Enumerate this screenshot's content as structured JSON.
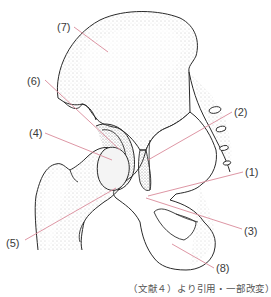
{
  "figure": {
    "type": "anatomical-illustration",
    "leader_line_color": "#d98a9a",
    "outline_color": "#2a2a2a",
    "stipple_color": "#8a8a8a"
  },
  "labels": [
    {
      "id": "1",
      "text": "(1)"
    },
    {
      "id": "2",
      "text": "(2)"
    },
    {
      "id": "3",
      "text": "(3)"
    },
    {
      "id": "4",
      "text": "(4)"
    },
    {
      "id": "5",
      "text": "(5)"
    },
    {
      "id": "6",
      "text": "(6)"
    },
    {
      "id": "7",
      "text": "(7)"
    },
    {
      "id": "8",
      "text": "(8)"
    }
  ],
  "caption": "（文献４）より引用・一部改変）"
}
